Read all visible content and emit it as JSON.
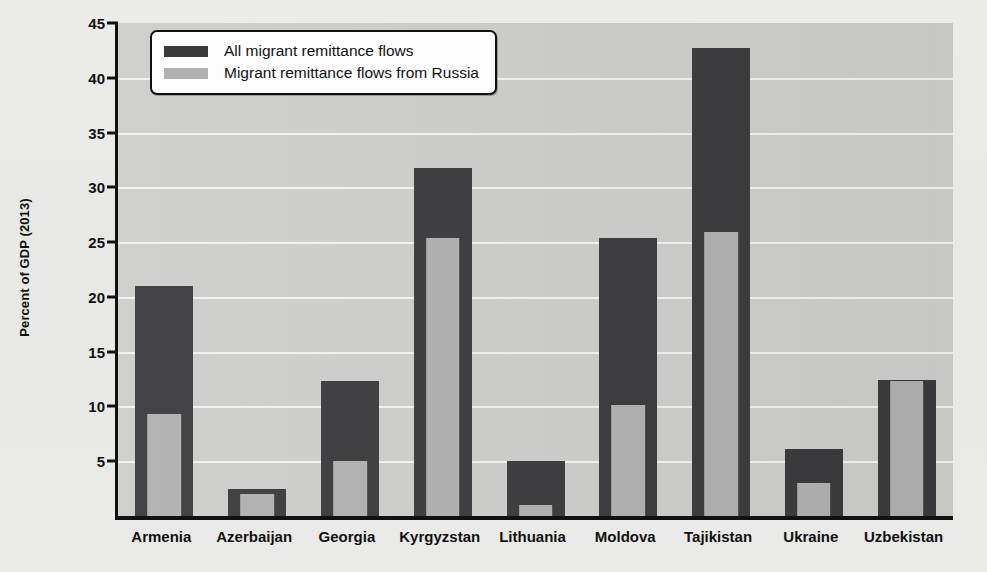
{
  "chart_data": {
    "type": "bar",
    "title": "",
    "xlabel": "",
    "ylabel": "Percent of GDP (2013)",
    "ylim": [
      0,
      45
    ],
    "yticks": [
      5,
      10,
      15,
      20,
      25,
      30,
      35,
      40,
      45
    ],
    "ytick_labels": [
      "5",
      "10",
      "15",
      "20",
      "25",
      "30",
      "35",
      "40",
      "45"
    ],
    "grid": true,
    "legend_position": "upper-left-inside",
    "categories": [
      "Armenia",
      "Azerbaijan",
      "Georgia",
      "Kyrgyzstan",
      "Lithuania",
      "Moldova",
      "Tajikistan",
      "Ukraine",
      "Uzbekistan"
    ],
    "series": [
      {
        "name": "All migrant remittance flows",
        "color": "#3a3a3c",
        "values": [
          21.0,
          2.5,
          12.3,
          31.8,
          5.0,
          25.4,
          42.7,
          6.1,
          12.4
        ]
      },
      {
        "name": "Migrant remittance flows from Russia",
        "color": "#b0b0b0",
        "values": [
          9.3,
          2.0,
          5.0,
          25.4,
          1.0,
          10.1,
          25.9,
          3.0,
          12.3
        ]
      }
    ]
  },
  "legend": {
    "items": [
      {
        "label": "All migrant remittance flows",
        "color": "#3a3a3c"
      },
      {
        "label": "Migrant remittance flows from Russia",
        "color": "#b0b0b0"
      }
    ]
  },
  "axes": {
    "y_axis_title": "Percent of GDP (2013)"
  },
  "colors": {
    "total_bar": "#3a3a3c",
    "russia_bar": "#b0b0b0",
    "plot_background": "#cdcdcb",
    "page_background": "#e9e9e7",
    "gridline": "#f2f2f0",
    "axis": "#111111"
  }
}
